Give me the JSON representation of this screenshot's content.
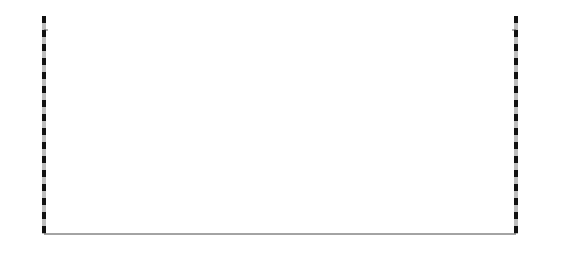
{
  "axes": {
    "y_left_title": "高程/m",
    "y_right_title": "高程/m",
    "x_title": "距离/m",
    "y_ticks": [
      "80",
      "60",
      "40",
      "20",
      "0",
      "-20",
      "-40",
      "-60",
      "-80"
    ],
    "y_values": [
      80,
      60,
      40,
      20,
      0,
      -20,
      -40,
      -60,
      -80
    ],
    "x_ticks": [
      "0",
      "200",
      "400",
      "600",
      "800",
      "1000",
      "1200",
      "1400"
    ],
    "x_values": [
      0,
      200,
      400,
      600,
      800,
      1000,
      1200,
      1400
    ],
    "xlim": [
      0,
      1400
    ],
    "ylim": [
      -90,
      90
    ]
  },
  "annotations": {
    "left_bank": "左岸",
    "right_bank": "右岸",
    "water_level": "9m",
    "water_symbol": "▽"
  },
  "chart_data": {
    "type": "line",
    "title": "",
    "xlabel": "距离/m",
    "ylabel": "高程/m",
    "xlim": [
      0,
      1400
    ],
    "ylim": [
      -90,
      90
    ],
    "grid": false,
    "legend": "none",
    "series": [
      {
        "name": "ground-surface",
        "style": "solid",
        "points": [
          [
            20,
            80
          ],
          [
            60,
            72
          ],
          [
            110,
            62
          ],
          [
            160,
            56
          ],
          [
            210,
            49
          ],
          [
            260,
            42
          ],
          [
            300,
            36
          ],
          [
            345,
            31
          ],
          [
            385,
            29
          ],
          [
            430,
            27
          ],
          [
            470,
            24
          ],
          [
            500,
            20
          ],
          [
            520,
            14
          ],
          [
            545,
            8
          ],
          [
            560,
            4
          ],
          [
            575,
            -1
          ],
          [
            600,
            -5
          ],
          [
            620,
            -44
          ],
          [
            640,
            -52
          ],
          [
            660,
            -57
          ],
          [
            690,
            -59
          ],
          [
            720,
            -58
          ],
          [
            745,
            -53
          ],
          [
            760,
            -44
          ],
          [
            770,
            0
          ],
          [
            800,
            4
          ],
          [
            830,
            9
          ],
          [
            870,
            13
          ],
          [
            910,
            17
          ],
          [
            950,
            21
          ],
          [
            1000,
            26
          ],
          [
            1050,
            33
          ],
          [
            1090,
            42
          ],
          [
            1120,
            55
          ],
          [
            1150,
            66
          ],
          [
            1200,
            75
          ],
          [
            1260,
            80
          ],
          [
            1330,
            82
          ],
          [
            1390,
            83
          ]
        ]
      },
      {
        "name": "weathering-boundary",
        "style": "dashed",
        "points": [
          [
            55,
            28
          ],
          [
            120,
            18
          ],
          [
            200,
            6
          ],
          [
            280,
            -5
          ],
          [
            360,
            -14
          ],
          [
            440,
            -22
          ],
          [
            520,
            -28
          ],
          [
            600,
            -33
          ],
          [
            680,
            -37
          ],
          [
            770,
            -34
          ],
          [
            850,
            -28
          ],
          [
            920,
            -20
          ],
          [
            1000,
            -10
          ],
          [
            1080,
            3
          ],
          [
            1160,
            19
          ],
          [
            1240,
            34
          ],
          [
            1320,
            47
          ],
          [
            1390,
            56
          ]
        ]
      },
      {
        "name": "deep-bedrock-boundary",
        "style": "solid",
        "points": [
          [
            60,
            -66
          ],
          [
            150,
            -70
          ],
          [
            240,
            -72
          ],
          [
            330,
            -71
          ],
          [
            430,
            -69
          ],
          [
            530,
            -66
          ],
          [
            640,
            -62
          ],
          [
            760,
            -57
          ],
          [
            880,
            -55
          ],
          [
            1000,
            -57
          ],
          [
            1100,
            -61
          ],
          [
            1200,
            -64
          ],
          [
            1300,
            -62
          ],
          [
            1390,
            -58
          ]
        ]
      },
      {
        "name": "river-channel",
        "style": "solid",
        "points": [
          [
            600,
            -5
          ],
          [
            615,
            -44
          ],
          [
            630,
            -50
          ],
          [
            660,
            -54
          ],
          [
            720,
            -54
          ],
          [
            745,
            -50
          ],
          [
            758,
            -44
          ],
          [
            770,
            0
          ]
        ]
      }
    ],
    "boreholes": [
      {
        "id": "L-7",
        "x": 120,
        "top": 60,
        "bottom": -22,
        "label_x": 100,
        "label_y": 66,
        "markers": [
          {
            "depth_elev": 33,
            "value": "0.45",
            "shape": "circle"
          },
          {
            "depth_elev": 27,
            "value": "2.50",
            "shape": "circle"
          },
          {
            "depth_elev": 21,
            "value": "2.00",
            "shape": "circle"
          }
        ]
      },
      {
        "id": "L-3",
        "x": 253,
        "top": 44,
        "bottom": -42,
        "label_x": 233,
        "label_y": 52,
        "markers": [
          {
            "depth_elev": 24,
            "value": "1.70",
            "shape": "circle"
          },
          {
            "depth_elev": -1,
            "value": "1.60",
            "shape": "circle"
          }
        ]
      },
      {
        "id": "L-8",
        "x": 353,
        "top": 32,
        "bottom": -36,
        "label_x": 333,
        "label_y": 40,
        "markers": [
          {
            "depth_elev": 9,
            "value": "10.80",
            "shape": "capsule"
          }
        ]
      },
      {
        "id": "L-2",
        "x": 462,
        "top": 28,
        "bottom": -28,
        "label_x": 442,
        "label_y": 36,
        "markers": [
          {
            "depth_elev": -4,
            "value": "3.0",
            "shape": "circle"
          },
          {
            "depth_elev": -10,
            "value": "1.0",
            "shape": "circle"
          }
        ]
      },
      {
        "id": "L-1",
        "x": 560,
        "top": 22,
        "bottom": -32,
        "label_x": 540,
        "label_y": 30,
        "markers": [
          {
            "depth_elev": 9,
            "value": "0.45",
            "shape": "circle"
          },
          {
            "depth_elev": 5,
            "value": "1.45",
            "shape": "circle"
          },
          {
            "depth_elev": 1,
            "value": "1.50",
            "shape": "circle"
          },
          {
            "depth_elev": -3,
            "value": "0.70",
            "shape": "circle"
          },
          {
            "depth_elev": -19,
            "value": "2.00",
            "shape": "circle"
          },
          {
            "depth_elev": -25,
            "value": "3.30",
            "shape": "circle"
          }
        ]
      },
      {
        "id": "R-5",
        "x": 900,
        "top": 17,
        "bottom": -48,
        "label_x": 880,
        "label_y": 25,
        "markers": [
          {
            "depth_elev": 8,
            "value": "1.20",
            "shape": "circle"
          },
          {
            "depth_elev": -2,
            "value": "1.00",
            "shape": "circle"
          }
        ]
      },
      {
        "id": "R-2",
        "x": 1010,
        "top": 25,
        "bottom": -44,
        "label_x": 990,
        "label_y": 35,
        "markers": [
          {
            "depth_elev": 21,
            "value": "0.355",
            "shape": "circle"
          }
        ]
      },
      {
        "id": "R-4",
        "x": 1110,
        "top": 46,
        "bottom": -44,
        "label_x": 1090,
        "label_y": 54,
        "markers": [
          {
            "depth_elev": 25,
            "value": "0.70",
            "shape": "circle"
          }
        ]
      },
      {
        "id": "",
        "x": 1235,
        "top": 78,
        "bottom": -36,
        "label_x": 1215,
        "label_y": 86,
        "markers": [
          {
            "depth_elev": 40,
            "value": "0.50",
            "shape": "circle"
          }
        ]
      }
    ],
    "water_level": {
      "elevation": 4,
      "x": 680,
      "label": "9m",
      "symbol_x": 640
    }
  }
}
